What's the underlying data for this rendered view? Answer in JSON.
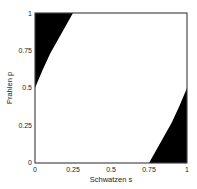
{
  "chart_data": {
    "type": "area",
    "title": "",
    "xlabel": "Schwatzen s",
    "ylabel": "Prahlen p",
    "xlim": [
      0,
      1
    ],
    "ylim": [
      0,
      1
    ],
    "xticks": [
      "0",
      "0.25",
      "0.5",
      "0.75",
      "1"
    ],
    "yticks": [
      "0",
      "0.25",
      "0.5",
      "0.75",
      "1"
    ],
    "grid": false,
    "legend": null,
    "regions": [
      {
        "name": "top-left filled region",
        "fill": "#000000",
        "boundary": [
          [
            0,
            0.5
          ],
          [
            0.05,
            0.62
          ],
          [
            0.1,
            0.73
          ],
          [
            0.15,
            0.82
          ],
          [
            0.2,
            0.91
          ],
          [
            0.25,
            1.0
          ]
        ],
        "closes_to": [
          [
            0,
            1
          ]
        ]
      },
      {
        "name": "bottom-right filled region",
        "fill": "#000000",
        "boundary": [
          [
            0.75,
            0
          ],
          [
            0.8,
            0.09
          ],
          [
            0.85,
            0.18
          ],
          [
            0.9,
            0.27
          ],
          [
            0.95,
            0.38
          ],
          [
            1.0,
            0.5
          ]
        ],
        "closes_to": [
          [
            1,
            0
          ]
        ]
      }
    ]
  }
}
